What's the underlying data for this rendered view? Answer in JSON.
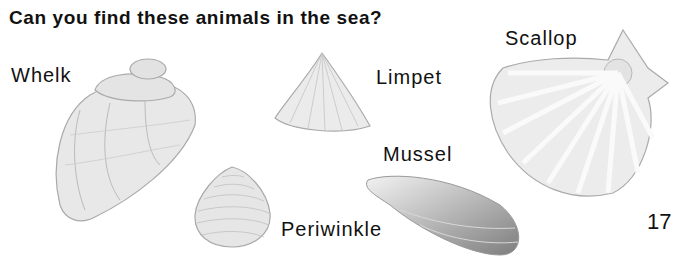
{
  "page": {
    "title": "Can you find these animals in the sea?",
    "page_number": "17"
  },
  "animals": [
    {
      "name": "Whelk",
      "icon": "whelk-shell-illustration"
    },
    {
      "name": "Limpet",
      "icon": "limpet-shell-illustration"
    },
    {
      "name": "Scallop",
      "icon": "scallop-shell-illustration"
    },
    {
      "name": "Mussel",
      "icon": "mussel-shell-illustration"
    },
    {
      "name": "Periwinkle",
      "icon": "periwinkle-shell-illustration"
    }
  ],
  "colors": {
    "text": "#111111",
    "shell_fill": "#e6e6e6",
    "shell_line": "#a8a8a8",
    "mussel_dark": "#8a8a8a"
  }
}
